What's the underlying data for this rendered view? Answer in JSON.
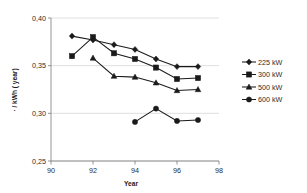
{
  "chart_data": {
    "type": "line",
    "title": "",
    "xlabel": "Year",
    "ylabel": "· / kWh ( year)",
    "xlim": [
      90,
      98
    ],
    "ylim": [
      0.25,
      0.4
    ],
    "xticks": [
      "90",
      "92",
      "94",
      "96",
      "98"
    ],
    "xtick_values": [
      90,
      92,
      94,
      96,
      98
    ],
    "yticks": [
      "0,25",
      "0,30",
      "0,35",
      "0,40"
    ],
    "ytick_values": [
      0.25,
      0.3,
      0.35,
      0.4
    ],
    "grid": "horizontal",
    "legend_position": "right",
    "series": [
      {
        "name": "225 kW",
        "marker": "diamond",
        "x": [
          91,
          92,
          93,
          94,
          95,
          96,
          97
        ],
        "values": [
          0.381,
          0.377,
          0.372,
          0.367,
          0.357,
          0.349,
          0.349
        ]
      },
      {
        "name": "300 kW",
        "marker": "square",
        "x": [
          91,
          92,
          93,
          94,
          95,
          96,
          97
        ],
        "values": [
          0.36,
          0.38,
          0.363,
          0.357,
          0.348,
          0.336,
          0.337
        ]
      },
      {
        "name": "500 kW",
        "marker": "triangle",
        "x": [
          92,
          93,
          94,
          95,
          96,
          97
        ],
        "values": [
          0.358,
          0.339,
          0.338,
          0.332,
          0.324,
          0.325
        ]
      },
      {
        "name": "600 kW",
        "marker": "circle",
        "x": [
          94,
          95,
          96,
          97
        ],
        "values": [
          0.291,
          0.305,
          0.292,
          0.293
        ]
      }
    ]
  },
  "legend": {
    "items": [
      {
        "label": "225 kW",
        "marker": "diamond"
      },
      {
        "label": "300 kW",
        "marker": "square"
      },
      {
        "label": "500 kW",
        "marker": "triangle"
      },
      {
        "label": "600 kW",
        "marker": "circle"
      }
    ]
  },
  "colors": {
    "series": "#1a1a1a",
    "grid": "#c9c9c9",
    "axis": "#7a7a7a",
    "background": "#ffffff"
  }
}
